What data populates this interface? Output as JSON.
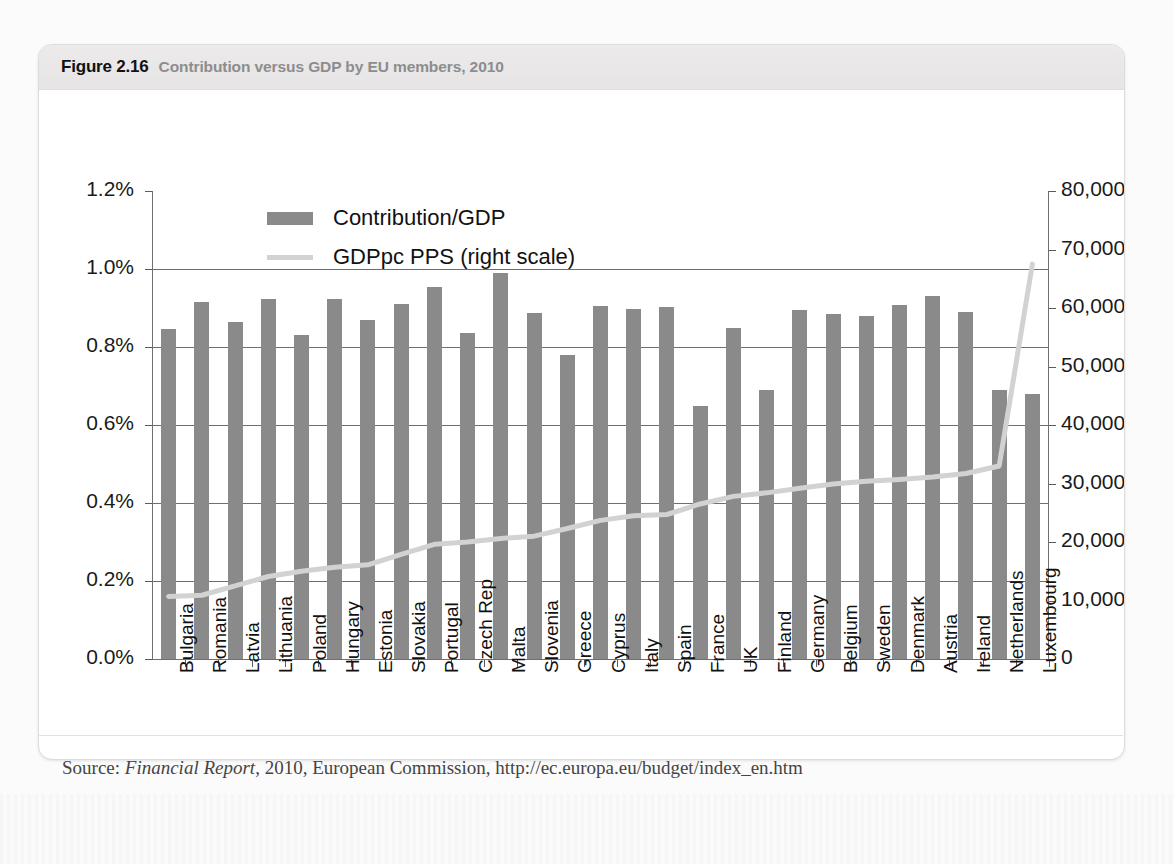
{
  "figure": {
    "number": "Figure 2.16",
    "title": "Contribution versus GDP by EU members, 2010",
    "source_prefix": "Source:",
    "source_italic": "Financial Report",
    "source_rest": ", 2010, European Commission, http://ec.europa.eu/budget/index_en.htm"
  },
  "legend": {
    "items": [
      {
        "label": "Contribution/GDP",
        "type": "bar",
        "color": "#8a8a8a"
      },
      {
        "label": "GDPpc PPS (right scale)",
        "type": "line",
        "color": "#d2d2d2"
      }
    ]
  },
  "colors": {
    "bar": "#8a8a8a",
    "line": "#d2d2d2",
    "axis": "#6f6f6f",
    "header_band": "#e9e7e7",
    "text": "#111111",
    "title_gray": "#8d8d8d"
  },
  "chart_data": {
    "type": "bar",
    "title": "Contribution versus GDP by EU members, 2010",
    "xlabel": "",
    "ylabel": "",
    "ylabel_right": "",
    "grid": true,
    "legend_position": "top-center",
    "ylim": [
      0,
      1.2
    ],
    "ylim_right": [
      0,
      80000
    ],
    "ytick_labels": [
      "0.0%",
      "0.2%",
      "0.4%",
      "0.6%",
      "0.8%",
      "1.0%",
      "1.2%"
    ],
    "ytick_values": [
      0,
      0.2,
      0.4,
      0.6,
      0.8,
      1.0,
      1.2
    ],
    "ytick_labels_right": [
      "0",
      "10,000",
      "20,000",
      "30,000",
      "40,000",
      "50,000",
      "60,000",
      "70,000",
      "80,000"
    ],
    "ytick_values_right": [
      0,
      10000,
      20000,
      30000,
      40000,
      50000,
      60000,
      70000,
      80000
    ],
    "categories": [
      "Bulgaria",
      "Romania",
      "Latvia",
      "Lithuania",
      "Poland",
      "Hungary",
      "Estonia",
      "Slovakia",
      "Portugal",
      "Czech Rep",
      "Malta",
      "Slovenia",
      "Greece",
      "Cyprus",
      "Italy",
      "Spain",
      "France",
      "UK",
      "Finland",
      "Germany",
      "Belgium",
      "Sweden",
      "Denmark",
      "Austria",
      "Ireland",
      "Netherlands",
      "Luxembourg"
    ],
    "series": [
      {
        "name": "Contribution/GDP",
        "type": "bar",
        "axis": "left",
        "unit": "%",
        "color": "#8a8a8a",
        "values": [
          0.845,
          0.915,
          0.865,
          0.922,
          0.832,
          0.923,
          0.868,
          0.911,
          0.955,
          0.835,
          0.99,
          0.888,
          0.78,
          0.905,
          0.898,
          0.903,
          0.648,
          0.85,
          0.69,
          0.896,
          0.885,
          0.88,
          0.908,
          0.93,
          0.89,
          0.69,
          0.68
        ]
      },
      {
        "name": "GDPpc PPS (right scale)",
        "type": "line",
        "axis": "right",
        "unit": "PPS",
        "color": "#d2d2d2",
        "values": [
          10700,
          10900,
          12500,
          14100,
          15000,
          15700,
          16100,
          17900,
          19600,
          20000,
          20600,
          21000,
          22300,
          23700,
          24500,
          24700,
          26500,
          27800,
          28400,
          29200,
          29900,
          30400,
          30700,
          31100,
          31700,
          33000,
          67500
        ]
      }
    ]
  }
}
